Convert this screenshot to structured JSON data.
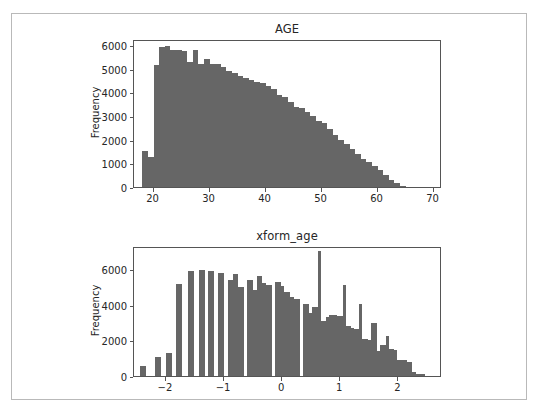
{
  "figure": {
    "background_color": "#ffffff",
    "border_color": "#b9b9b9",
    "bar_color": "#666666",
    "axis_color": "#555555",
    "text_color": "#262626"
  },
  "chart_data": [
    {
      "type": "bar",
      "title": "AGE",
      "xlabel": "",
      "ylabel": "Frequency",
      "xlim": [
        16.5,
        71.5
      ],
      "ylim": [
        0,
        6250
      ],
      "xticks": [
        20,
        30,
        40,
        50,
        60,
        70
      ],
      "xtick_labels": [
        "20",
        "30",
        "40",
        "50",
        "60",
        "70"
      ],
      "yticks": [
        0,
        1000,
        2000,
        3000,
        4000,
        5000,
        6000
      ],
      "ytick_labels": [
        "0",
        "1000",
        "2000",
        "3000",
        "4000",
        "5000",
        "6000"
      ],
      "grid": false,
      "legend": null,
      "bin_edges": [
        18,
        19,
        20,
        21,
        22,
        23,
        24,
        25,
        26,
        27,
        28,
        29,
        30,
        31,
        32,
        33,
        34,
        35,
        36,
        37,
        38,
        39,
        40,
        41,
        42,
        43,
        44,
        45,
        46,
        47,
        48,
        49,
        50,
        51,
        52,
        53,
        54,
        55,
        56,
        57,
        58,
        59,
        60,
        61,
        62,
        63,
        64,
        65
      ],
      "values": [
        1500,
        1250,
        5150,
        5900,
        5950,
        5800,
        5800,
        5750,
        5300,
        5800,
        5200,
        5400,
        5200,
        5200,
        5050,
        4900,
        4800,
        4700,
        4600,
        4500,
        4450,
        4400,
        4250,
        4150,
        3900,
        3800,
        3600,
        3400,
        3350,
        3150,
        3000,
        2800,
        2700,
        2450,
        2200,
        2000,
        1800,
        1600,
        1400,
        1200,
        1050,
        900,
        700,
        500,
        300,
        150,
        50
      ]
    },
    {
      "type": "bar",
      "title": "xform_age",
      "xlabel": "",
      "ylabel": "Frequency",
      "xlim": [
        -2.55,
        2.75
      ],
      "ylim": [
        0,
        7300
      ],
      "xticks": [
        -2,
        -1,
        0,
        1,
        2
      ],
      "xtick_labels": [
        "−2",
        "−1",
        "0",
        "1",
        "2"
      ],
      "yticks": [
        0,
        2000,
        4000,
        6000
      ],
      "ytick_labels": [
        "0",
        "2000",
        "4000",
        "6000"
      ],
      "grid": false,
      "legend": null,
      "bin_edges": [
        -2.45,
        -2.35,
        -2.19,
        -2.09,
        -2.0,
        -1.9,
        -1.82,
        -1.72,
        -1.62,
        -1.52,
        -1.43,
        -1.33,
        -1.27,
        -1.17,
        -1.1,
        -1.0,
        -0.94,
        -0.84,
        -0.76,
        -0.66,
        -0.6,
        -0.5,
        -0.44,
        -0.34,
        -0.28,
        -0.18,
        -0.12,
        -0.02,
        0.03,
        0.13,
        0.2,
        0.3,
        0.36,
        0.46,
        0.52,
        0.62,
        0.66,
        0.76,
        0.8,
        0.9,
        0.95,
        1.05,
        1.09,
        1.19,
        1.23,
        1.33,
        1.38,
        1.48,
        1.53,
        1.63,
        1.68,
        1.78,
        1.83,
        1.93,
        1.98,
        2.08,
        2.14,
        2.24,
        2.3,
        2.45
      ],
      "bars": [
        {
          "x0": -2.45,
          "x1": -2.35,
          "value": 550
        },
        {
          "x0": -2.19,
          "x1": -2.09,
          "value": 1050
        },
        {
          "x0": -2.0,
          "x1": -1.9,
          "value": 1300
        },
        {
          "x0": -1.82,
          "x1": -1.72,
          "value": 5150
        },
        {
          "x0": -1.62,
          "x1": -1.52,
          "value": 5900
        },
        {
          "x0": -1.43,
          "x1": -1.33,
          "value": 5980
        },
        {
          "x0": -1.27,
          "x1": -1.17,
          "value": 5870
        },
        {
          "x0": -1.1,
          "x1": -1.0,
          "value": 5780
        },
        {
          "x0": -0.94,
          "x1": -0.84,
          "value": 5400
        },
        {
          "x0": -0.84,
          "x1": -0.76,
          "value": 5750
        },
        {
          "x0": -0.76,
          "x1": -0.66,
          "value": 5000
        },
        {
          "x0": -0.6,
          "x1": -0.5,
          "value": 5400
        },
        {
          "x0": -0.5,
          "x1": -0.44,
          "value": 4850
        },
        {
          "x0": -0.44,
          "x1": -0.34,
          "value": 5600
        },
        {
          "x0": -0.34,
          "x1": -0.28,
          "value": 5250
        },
        {
          "x0": -0.28,
          "x1": -0.18,
          "value": 5100
        },
        {
          "x0": -0.12,
          "x1": -0.02,
          "value": 5300
        },
        {
          "x0": -0.02,
          "x1": 0.03,
          "value": 5050
        },
        {
          "x0": 0.03,
          "x1": 0.13,
          "value": 4700
        },
        {
          "x0": 0.13,
          "x1": 0.2,
          "value": 4450
        },
        {
          "x0": 0.2,
          "x1": 0.3,
          "value": 4300
        },
        {
          "x0": 0.36,
          "x1": 0.46,
          "value": 4050
        },
        {
          "x0": 0.46,
          "x1": 0.52,
          "value": 3550
        },
        {
          "x0": 0.52,
          "x1": 0.62,
          "value": 3900
        },
        {
          "x0": 0.62,
          "x1": 0.66,
          "value": 7000
        },
        {
          "x0": 0.66,
          "x1": 0.76,
          "value": 3100
        },
        {
          "x0": 0.76,
          "x1": 0.8,
          "value": 3300
        },
        {
          "x0": 0.8,
          "x1": 0.9,
          "value": 3400
        },
        {
          "x0": 0.9,
          "x1": 0.95,
          "value": 3400
        },
        {
          "x0": 0.95,
          "x1": 1.05,
          "value": 3350
        },
        {
          "x0": 1.05,
          "x1": 1.09,
          "value": 5100
        },
        {
          "x0": 1.09,
          "x1": 1.19,
          "value": 2800
        },
        {
          "x0": 1.19,
          "x1": 1.23,
          "value": 2700
        },
        {
          "x0": 1.23,
          "x1": 1.33,
          "value": 2650
        },
        {
          "x0": 1.33,
          "x1": 1.38,
          "value": 4050
        },
        {
          "x0": 1.38,
          "x1": 1.48,
          "value": 2100
        },
        {
          "x0": 1.48,
          "x1": 1.53,
          "value": 2050
        },
        {
          "x0": 1.53,
          "x1": 1.63,
          "value": 2950
        },
        {
          "x0": 1.63,
          "x1": 1.68,
          "value": 1400
        },
        {
          "x0": 1.68,
          "x1": 1.78,
          "value": 1750
        },
        {
          "x0": 1.78,
          "x1": 1.83,
          "value": 2250
        },
        {
          "x0": 1.83,
          "x1": 1.93,
          "value": 1500
        },
        {
          "x0": 1.93,
          "x1": 1.98,
          "value": 1450
        },
        {
          "x0": 1.98,
          "x1": 2.08,
          "value": 900
        },
        {
          "x0": 2.08,
          "x1": 2.14,
          "value": 900
        },
        {
          "x0": 2.14,
          "x1": 2.24,
          "value": 800
        },
        {
          "x0": 2.24,
          "x1": 2.3,
          "value": 250
        },
        {
          "x0": 2.3,
          "x1": 2.45,
          "value": 120
        }
      ]
    }
  ]
}
